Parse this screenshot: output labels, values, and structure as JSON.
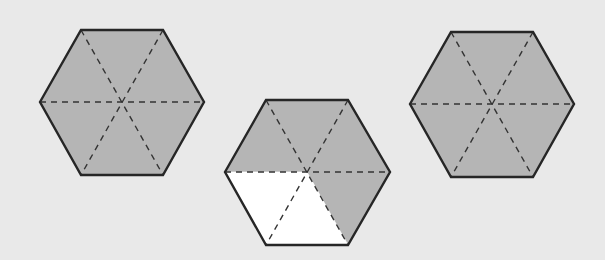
{
  "figure": {
    "background": "#e9e9e9",
    "shade_color": "#b5b5b5",
    "unshaded_color": "#ffffff",
    "stroke_color": "#262626",
    "dash_color": "#333333"
  },
  "hexagons": [
    {
      "id": "left",
      "center": [
        122,
        102
      ],
      "vertices": [
        [
          40,
          102
        ],
        [
          81,
          30
        ],
        [
          163,
          30
        ],
        [
          204,
          102
        ],
        [
          163,
          175
        ],
        [
          81,
          175
        ]
      ],
      "sectors_total": 6,
      "sectors_shaded": 6,
      "shaded_sectors": [
        true,
        true,
        true,
        true,
        true,
        true
      ]
    },
    {
      "id": "middle",
      "center": [
        307,
        172
      ],
      "vertices": [
        [
          225,
          172
        ],
        [
          266,
          100
        ],
        [
          348,
          100
        ],
        [
          390,
          172
        ],
        [
          348,
          245
        ],
        [
          266,
          245
        ]
      ],
      "sectors_total": 6,
      "sectors_shaded": 4,
      "shaded_sectors": [
        true,
        true,
        true,
        true,
        false,
        false
      ]
    },
    {
      "id": "right",
      "center": [
        492,
        104
      ],
      "vertices": [
        [
          410,
          104
        ],
        [
          451,
          32
        ],
        [
          533,
          32
        ],
        [
          574,
          104
        ],
        [
          533,
          177
        ],
        [
          451,
          177
        ]
      ],
      "sectors_total": 6,
      "sectors_shaded": 6,
      "shaded_sectors": [
        true,
        true,
        true,
        true,
        true,
        true
      ]
    }
  ]
}
